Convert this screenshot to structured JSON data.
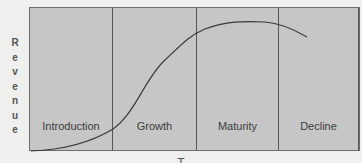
{
  "diagram": {
    "title_cropped": "",
    "y_axis_label": [
      "R",
      "e",
      "v",
      "e",
      "n",
      "u",
      "e"
    ],
    "x_axis_label_cropped": "T",
    "stages": [
      {
        "label": "Introduction"
      },
      {
        "label": "Growth"
      },
      {
        "label": "Maturity"
      },
      {
        "label": "Decline"
      }
    ],
    "curve": {
      "description": "Product life cycle revenue curve",
      "color": "#3a3a3a"
    },
    "colors": {
      "background": "#efefee",
      "chart_fill": "#c6c6c6",
      "divider": "#555555"
    }
  }
}
